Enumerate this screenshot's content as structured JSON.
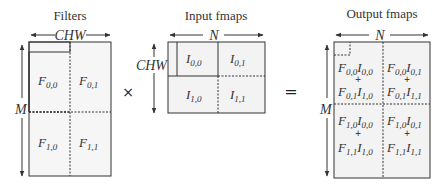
{
  "filters": {
    "title": "Filters",
    "width_label": "CHW",
    "height_label": "M",
    "cells": [
      {
        "base": "F",
        "sub": "0,0"
      },
      {
        "base": "F",
        "sub": "0,1"
      },
      {
        "base": "F",
        "sub": "1,0"
      },
      {
        "base": "F",
        "sub": "1,1"
      }
    ]
  },
  "operators": {
    "multiply": "×",
    "equals": "="
  },
  "input": {
    "title": "Input fmaps",
    "width_label": "N",
    "height_label": "CHW",
    "cells": [
      {
        "base": "I",
        "sub": "0,0"
      },
      {
        "base": "I",
        "sub": "0,1"
      },
      {
        "base": "I",
        "sub": "1,0"
      },
      {
        "base": "I",
        "sub": "1,1"
      }
    ]
  },
  "output": {
    "title": "Output fmaps",
    "width_label": "N",
    "height_label": "M",
    "plus": "+",
    "cells": [
      {
        "t1": [
          "F",
          "0,0",
          "I",
          "0,0"
        ],
        "t2": [
          "F",
          "0,1",
          "I",
          "1,0"
        ]
      },
      {
        "t1": [
          "F",
          "0,0",
          "I",
          "0,1"
        ],
        "t2": [
          "F",
          "0,1",
          "I",
          "1,1"
        ]
      },
      {
        "t1": [
          "F",
          "1,0",
          "I",
          "0,0"
        ],
        "t2": [
          "F",
          "1,1",
          "I",
          "1,0"
        ]
      },
      {
        "t1": [
          "F",
          "1,0",
          "I",
          "0,1"
        ],
        "t2": [
          "F",
          "1,1",
          "I",
          "1,1"
        ]
      }
    ]
  },
  "colors": {
    "box_fill": "#f3f3f3",
    "stroke": "#333333"
  }
}
